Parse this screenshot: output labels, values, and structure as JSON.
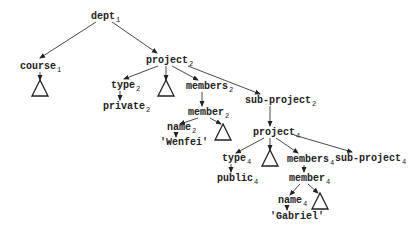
{
  "diagram": {
    "type": "tree",
    "nodes": [
      {
        "id": "dept1",
        "label": "dept",
        "sub": "1",
        "x": 91,
        "y": 19
      },
      {
        "id": "course1",
        "label": "course",
        "sub": "1",
        "x": 20,
        "y": 69
      },
      {
        "id": "project2",
        "label": "project",
        "sub": "2",
        "x": 146,
        "y": 63
      },
      {
        "id": "type2",
        "label": "type",
        "sub": "2",
        "x": 111,
        "y": 88
      },
      {
        "id": "private2",
        "label": "private",
        "sub": "2",
        "x": 103,
        "y": 109
      },
      {
        "id": "members2",
        "label": "members",
        "sub": "2",
        "x": 186,
        "y": 89
      },
      {
        "id": "member2",
        "label": "member",
        "sub": "2",
        "x": 188,
        "y": 115
      },
      {
        "id": "name2",
        "label": "name",
        "sub": "2",
        "x": 167,
        "y": 130
      },
      {
        "id": "wenfei",
        "label": "'Wenfei'",
        "sub": "",
        "x": 160,
        "y": 145
      },
      {
        "id": "subproject2",
        "label": "sub-project",
        "sub": "2",
        "x": 245,
        "y": 103
      },
      {
        "id": "project4",
        "label": "project",
        "sub": "4",
        "x": 253,
        "y": 135
      },
      {
        "id": "type4",
        "label": "type",
        "sub": "4",
        "x": 222,
        "y": 161
      },
      {
        "id": "public4",
        "label": "public",
        "sub": "4",
        "x": 217,
        "y": 181
      },
      {
        "id": "members4",
        "label": "members",
        "sub": "4",
        "x": 287,
        "y": 162
      },
      {
        "id": "member4",
        "label": "member",
        "sub": "4",
        "x": 289,
        "y": 181
      },
      {
        "id": "name4",
        "label": "name",
        "sub": "4",
        "x": 278,
        "y": 203
      },
      {
        "id": "gabriel",
        "label": "'Gabriel'",
        "sub": "",
        "x": 270,
        "y": 219
      },
      {
        "id": "subproject4",
        "label": "sub-project",
        "sub": "4",
        "x": 335,
        "y": 161
      }
    ],
    "subtrees": [
      {
        "id": "tri-course1",
        "parent": "course1",
        "x": 40,
        "y": 80
      },
      {
        "id": "tri-project2",
        "parent": "project2",
        "x": 166,
        "y": 80
      },
      {
        "id": "tri-member2",
        "parent": "member2",
        "x": 223,
        "y": 124
      },
      {
        "id": "tri-project4",
        "parent": "project4",
        "x": 270,
        "y": 150
      },
      {
        "id": "tri-member4",
        "parent": "member4",
        "x": 320,
        "y": 193
      }
    ],
    "edges": [
      {
        "from": "dept1",
        "to": "course1",
        "x1": 96,
        "y1": 22,
        "x2": 40,
        "y2": 58
      },
      {
        "from": "dept1",
        "to": "project2",
        "x1": 112,
        "y1": 22,
        "x2": 157,
        "y2": 53
      },
      {
        "from": "course1",
        "to": "tri-course1",
        "x1": 40,
        "y1": 72,
        "x2": 40,
        "y2": 80
      },
      {
        "from": "project2",
        "to": "type2",
        "x1": 158,
        "y1": 66,
        "x2": 124,
        "y2": 79
      },
      {
        "from": "project2",
        "to": "tri-project2",
        "x1": 166,
        "y1": 66,
        "x2": 166,
        "y2": 80
      },
      {
        "from": "project2",
        "to": "members2",
        "x1": 172,
        "y1": 66,
        "x2": 198,
        "y2": 80
      },
      {
        "from": "project2",
        "to": "subproject2",
        "x1": 188,
        "y1": 66,
        "x2": 260,
        "y2": 94
      },
      {
        "from": "type2",
        "to": "private2",
        "x1": 120,
        "y1": 91,
        "x2": 120,
        "y2": 100
      },
      {
        "from": "members2",
        "to": "member2",
        "x1": 202,
        "y1": 92,
        "x2": 202,
        "y2": 106
      },
      {
        "from": "member2",
        "to": "name2",
        "x1": 198,
        "y1": 118,
        "x2": 180,
        "y2": 124
      },
      {
        "from": "member2",
        "to": "tri-member2",
        "x1": 210,
        "y1": 118,
        "x2": 221,
        "y2": 124
      },
      {
        "from": "name2",
        "to": "wenfei",
        "x1": 176,
        "y1": 133,
        "x2": 176,
        "y2": 137
      },
      {
        "from": "subproject2",
        "to": "project4",
        "x1": 270,
        "y1": 106,
        "x2": 270,
        "y2": 126
      },
      {
        "from": "project4",
        "to": "type4",
        "x1": 264,
        "y1": 138,
        "x2": 236,
        "y2": 153
      },
      {
        "from": "project4",
        "to": "tri-project4",
        "x1": 270,
        "y1": 138,
        "x2": 270,
        "y2": 150
      },
      {
        "from": "project4",
        "to": "members4",
        "x1": 276,
        "y1": 138,
        "x2": 298,
        "y2": 153
      },
      {
        "from": "project4",
        "to": "subproject4",
        "x1": 294,
        "y1": 135,
        "x2": 352,
        "y2": 152
      },
      {
        "from": "type4",
        "to": "public4",
        "x1": 231,
        "y1": 164,
        "x2": 231,
        "y2": 172
      },
      {
        "from": "members4",
        "to": "member4",
        "x1": 304,
        "y1": 165,
        "x2": 304,
        "y2": 172
      },
      {
        "from": "member4",
        "to": "name4",
        "x1": 300,
        "y1": 184,
        "x2": 290,
        "y2": 195
      },
      {
        "from": "member4",
        "to": "tri-member4",
        "x1": 308,
        "y1": 184,
        "x2": 318,
        "y2": 193
      },
      {
        "from": "name4",
        "to": "gabriel",
        "x1": 287,
        "y1": 206,
        "x2": 287,
        "y2": 210
      }
    ]
  }
}
